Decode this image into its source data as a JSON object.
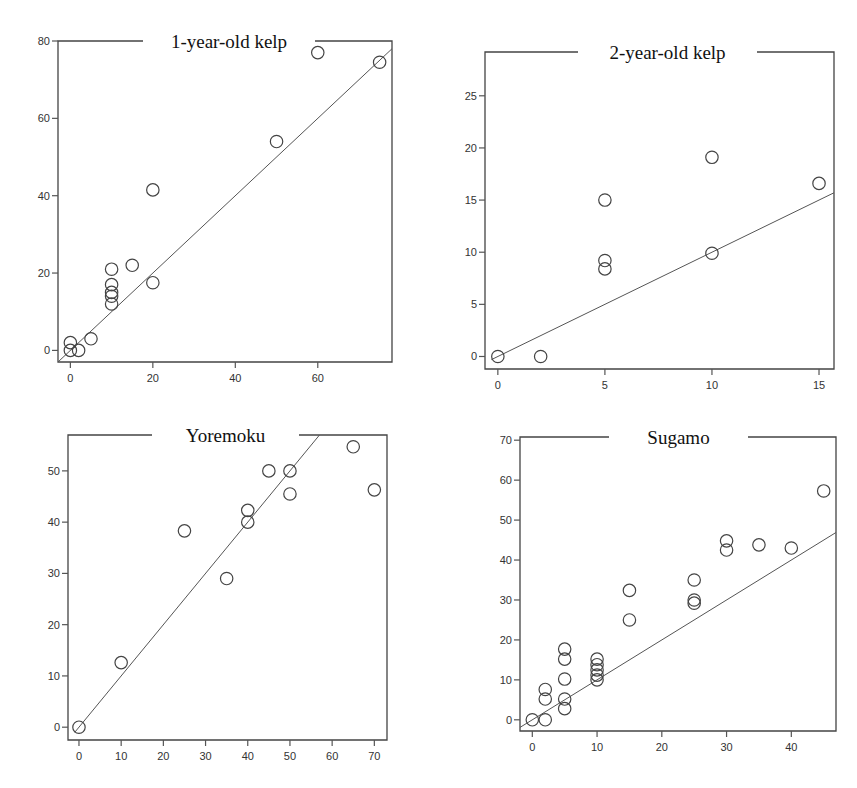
{
  "figure": {
    "panels": 4
  },
  "chart_data": [
    {
      "type": "scatter",
      "title": "1-year-old kelp",
      "xlabel": "",
      "ylabel": "",
      "xticks": [
        0,
        20,
        40,
        60
      ],
      "yticks": [
        0,
        20,
        40,
        60,
        80
      ],
      "xlim": [
        -3,
        78
      ],
      "ylim": [
        -3,
        80
      ],
      "points": [
        {
          "x": 0,
          "y": 0
        },
        {
          "x": 0,
          "y": 2
        },
        {
          "x": 2,
          "y": 0
        },
        {
          "x": 5,
          "y": 3
        },
        {
          "x": 10,
          "y": 12
        },
        {
          "x": 10,
          "y": 14
        },
        {
          "x": 10,
          "y": 15
        },
        {
          "x": 10,
          "y": 17
        },
        {
          "x": 10,
          "y": 21
        },
        {
          "x": 15,
          "y": 22
        },
        {
          "x": 20,
          "y": 17.5
        },
        {
          "x": 20,
          "y": 41.5
        },
        {
          "x": 50,
          "y": 54
        },
        {
          "x": 60,
          "y": 77
        },
        {
          "x": 75,
          "y": 74.5
        }
      ],
      "fit_line": {
        "slope": 1,
        "intercept": 0,
        "x_range": [
          -3,
          78
        ]
      }
    },
    {
      "type": "scatter",
      "title": "2-year-old kelp",
      "xlabel": "",
      "ylabel": "",
      "xticks": [
        0,
        5,
        10,
        15
      ],
      "yticks": [
        0,
        5,
        10,
        15,
        20,
        25
      ],
      "xlim": [
        -0.6,
        15.7
      ],
      "ylim": [
        -1.2,
        29.2
      ],
      "points": [
        {
          "x": 0,
          "y": 0
        },
        {
          "x": 2,
          "y": 0
        },
        {
          "x": 5,
          "y": 8.4
        },
        {
          "x": 5,
          "y": 9.2
        },
        {
          "x": 5,
          "y": 15
        },
        {
          "x": 10,
          "y": 9.9
        },
        {
          "x": 10,
          "y": 19.1
        },
        {
          "x": 15,
          "y": 16.6
        }
      ],
      "fit_line": {
        "slope": 1,
        "intercept": 0,
        "x_range": [
          -0.3,
          15.7
        ]
      }
    },
    {
      "type": "scatter",
      "title": "Yoremoku",
      "xlabel": "",
      "ylabel": "",
      "xticks": [
        0,
        10,
        20,
        30,
        40,
        50,
        60,
        70
      ],
      "yticks": [
        0,
        10,
        20,
        30,
        40,
        50
      ],
      "xlim": [
        -2.6,
        73
      ],
      "ylim": [
        -2.5,
        57
      ],
      "points": [
        {
          "x": 0,
          "y": 0
        },
        {
          "x": 10,
          "y": 12.6
        },
        {
          "x": 25,
          "y": 38.3
        },
        {
          "x": 35,
          "y": 29
        },
        {
          "x": 40,
          "y": 40
        },
        {
          "x": 40,
          "y": 42.3
        },
        {
          "x": 45,
          "y": 50
        },
        {
          "x": 50,
          "y": 50
        },
        {
          "x": 50,
          "y": 45.5
        },
        {
          "x": 65,
          "y": 54.7
        },
        {
          "x": 70,
          "y": 46.3
        }
      ],
      "fit_line": {
        "slope": 1,
        "intercept": 0,
        "x_range": [
          -1,
          57
        ]
      }
    },
    {
      "type": "scatter",
      "title": "Sugamo",
      "xlabel": "",
      "ylabel": "",
      "xticks": [
        0,
        10,
        20,
        30,
        40
      ],
      "yticks": [
        0,
        10,
        20,
        30,
        40,
        50,
        60,
        70
      ],
      "xlim": [
        -1.9,
        46.9
      ],
      "ylim": [
        -2.8,
        70.8
      ],
      "points": [
        {
          "x": 0,
          "y": 0
        },
        {
          "x": 2,
          "y": 0
        },
        {
          "x": 2,
          "y": 5.2
        },
        {
          "x": 2,
          "y": 7.6
        },
        {
          "x": 5,
          "y": 2.8
        },
        {
          "x": 5,
          "y": 5.2
        },
        {
          "x": 5,
          "y": 10.2
        },
        {
          "x": 5,
          "y": 15.2
        },
        {
          "x": 5,
          "y": 17.7
        },
        {
          "x": 10,
          "y": 10
        },
        {
          "x": 10,
          "y": 11.2
        },
        {
          "x": 10,
          "y": 12.5
        },
        {
          "x": 10,
          "y": 13.8
        },
        {
          "x": 10,
          "y": 15.2
        },
        {
          "x": 15,
          "y": 25
        },
        {
          "x": 15,
          "y": 32.4
        },
        {
          "x": 25,
          "y": 29.2
        },
        {
          "x": 25,
          "y": 30
        },
        {
          "x": 25,
          "y": 35
        },
        {
          "x": 30,
          "y": 42.5
        },
        {
          "x": 30,
          "y": 44.8
        },
        {
          "x": 35,
          "y": 43.8
        },
        {
          "x": 40,
          "y": 43
        },
        {
          "x": 45,
          "y": 57.3
        }
      ],
      "fit_line": {
        "slope": 1,
        "intercept": 0,
        "x_range": [
          -1.9,
          46.9
        ]
      }
    }
  ]
}
